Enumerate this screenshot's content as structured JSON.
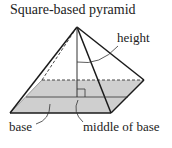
{
  "title": "Square-based pyramid",
  "labels": {
    "height": "height",
    "base": "base",
    "middle_of_base": "middle of base"
  },
  "colors": {
    "base_fill": "#cfcfcf",
    "line": "#1a1a1a"
  }
}
